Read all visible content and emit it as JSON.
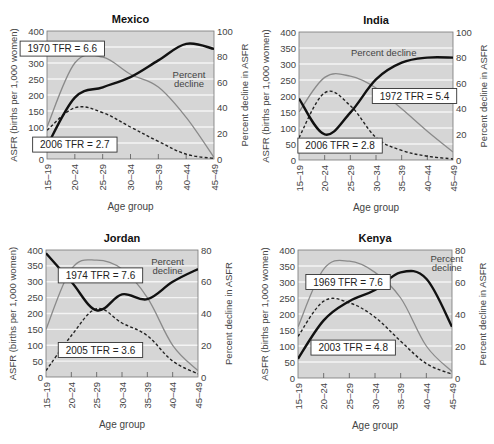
{
  "figure": {
    "colors": {
      "plot_bg": "#d6d6d6",
      "gridline": "#f4f4f4",
      "asfr_early": "#8a8a8a",
      "asfr_late": "#222222",
      "percent_decline": "#111111",
      "text": "#444444",
      "title": "#111111"
    }
  },
  "chart_data": [
    {
      "type": "line",
      "title": "Mexico",
      "xlabel": "Age group",
      "ylabel": "ASFR (births per 1,000 women)",
      "y2label": "Percent decline in ASFR",
      "categories": [
        "15–19",
        "20–24",
        "25–29",
        "30–34",
        "35–39",
        "40–44",
        "45–49"
      ],
      "ylim": [
        0,
        400
      ],
      "yticks": [
        0,
        50,
        100,
        150,
        200,
        250,
        300,
        350,
        400
      ],
      "y2lim": [
        0,
        100
      ],
      "y2ticks": [
        0,
        20,
        40,
        60,
        80,
        100
      ],
      "series": [
        {
          "name": "1970 TFR = 6.6",
          "role": "early",
          "axis": "left",
          "values": [
            100,
            300,
            318,
            265,
            225,
            130,
            5
          ]
        },
        {
          "name": "2006 TFR = 2.7",
          "role": "late",
          "axis": "left",
          "values": [
            90,
            160,
            145,
            100,
            55,
            15,
            2
          ]
        },
        {
          "name": "Percent decline",
          "role": "decline",
          "axis": "right",
          "values": [
            10,
            48,
            56,
            64,
            77,
            90,
            86
          ]
        }
      ],
      "annotations": [
        {
          "text": "1970 TFR = 6.6",
          "boxed": true,
          "x": 0.55,
          "y": 345
        },
        {
          "text": "2006 TFR = 2.7",
          "boxed": true,
          "x": 1.0,
          "y": 45
        },
        {
          "text": "Percent",
          "boxed": false,
          "x": 5.1,
          "y": 265
        },
        {
          "text": "decline",
          "boxed": false,
          "x": 5.1,
          "y": 235
        }
      ],
      "frame": {
        "x": 47,
        "y": 31,
        "w": 167,
        "h": 128
      }
    },
    {
      "type": "line",
      "title": "India",
      "xlabel": "Age group",
      "ylabel": "ASFR (births per 1,000 women)",
      "y2label": "Percent decline in ASFR",
      "categories": [
        "15–19",
        "20–24",
        "25–29",
        "30–34",
        "35–39",
        "40–44",
        "45–49"
      ],
      "ylim": [
        0,
        400
      ],
      "yticks": [
        0,
        50,
        100,
        150,
        200,
        250,
        300,
        350,
        400
      ],
      "y2lim": [
        0,
        100
      ],
      "y2ticks": [
        0,
        20,
        40,
        60,
        80,
        100
      ],
      "series": [
        {
          "name": "1972 TFR = 5.4",
          "role": "early",
          "axis": "left",
          "values": [
            150,
            258,
            262,
            225,
            160,
            90,
            25
          ]
        },
        {
          "name": "2006 TFR = 2.8",
          "role": "late",
          "axis": "left",
          "values": [
            70,
            210,
            170,
            70,
            30,
            12,
            3
          ]
        },
        {
          "name": "Percent decline",
          "role": "decline",
          "axis": "right",
          "values": [
            48,
            20,
            37,
            63,
            76,
            80,
            80
          ]
        }
      ],
      "annotations": [
        {
          "text": "Percent decline",
          "boxed": false,
          "x": 3.3,
          "y": 335
        },
        {
          "text": "1972 TFR = 5.4",
          "boxed": true,
          "x": 4.5,
          "y": 200
        },
        {
          "text": "2006 TFR = 2.8",
          "boxed": true,
          "x": 1.6,
          "y": 45
        }
      ],
      "frame": {
        "x": 299,
        "y": 32,
        "w": 154,
        "h": 128
      }
    },
    {
      "type": "line",
      "title": "Jordan",
      "xlabel": "Age group",
      "ylabel": "ASFR (births per 1,000 women)",
      "y2label": "Percent decline in ASFR",
      "categories": [
        "15–19",
        "20–24",
        "25–29",
        "30–34",
        "35–39",
        "40–44",
        "45–49"
      ],
      "ylim": [
        0,
        400
      ],
      "yticks": [
        0,
        50,
        100,
        150,
        200,
        250,
        300,
        350,
        400
      ],
      "y2lim": [
        0,
        80
      ],
      "y2ticks": [
        0,
        20,
        40,
        60,
        80
      ],
      "series": [
        {
          "name": "1974 TFR = 7.6",
          "role": "early",
          "axis": "left",
          "values": [
            150,
            340,
            368,
            340,
            250,
            100,
            20
          ]
        },
        {
          "name": "2005 TFR = 3.6",
          "role": "late",
          "axis": "left",
          "values": [
            20,
            130,
            215,
            170,
            130,
            50,
            10
          ]
        },
        {
          "name": "Percent decline",
          "role": "decline",
          "axis": "right",
          "values": [
            78,
            60,
            42,
            52,
            49,
            60,
            68
          ]
        }
      ],
      "annotations": [
        {
          "text": "1974 TFR = 7.6",
          "boxed": true,
          "x": 2.15,
          "y": 320
        },
        {
          "text": "2005 TFR = 3.6",
          "boxed": true,
          "x": 2.15,
          "y": 85
        },
        {
          "text": "Percent",
          "boxed": false,
          "x": 4.8,
          "y": 365
        },
        {
          "text": "decline",
          "boxed": false,
          "x": 4.8,
          "y": 335
        }
      ],
      "frame": {
        "x": 46,
        "y": 250,
        "w": 152,
        "h": 127
      }
    },
    {
      "type": "line",
      "title": "Kenya",
      "xlabel": "Age group",
      "ylabel": "ASFR (births per 1,000 women)",
      "y2label": "Percent decline in ASFR",
      "categories": [
        "15–19",
        "20–24",
        "25–29",
        "30–34",
        "35–39",
        "40–44",
        "45–49"
      ],
      "ylim": [
        0,
        400
      ],
      "yticks": [
        0,
        50,
        100,
        150,
        200,
        250,
        300,
        350,
        400
      ],
      "y2lim": [
        0,
        80
      ],
      "y2ticks": [
        0,
        20,
        40,
        60,
        80
      ],
      "series": [
        {
          "name": "1969 TFR = 7.6",
          "role": "early",
          "axis": "left",
          "values": [
            160,
            340,
            365,
            330,
            250,
            100,
            20
          ]
        },
        {
          "name": "2003 TFR = 4.8",
          "role": "late",
          "axis": "left",
          "values": [
            130,
            240,
            235,
            190,
            115,
            45,
            12
          ]
        },
        {
          "name": "Percent decline",
          "role": "decline",
          "axis": "right",
          "values": [
            12,
            36,
            48,
            55,
            66,
            62,
            32
          ]
        }
      ],
      "annotations": [
        {
          "text": "1969 TFR = 7.6",
          "boxed": true,
          "x": 1.95,
          "y": 300
        },
        {
          "text": "2003 TFR = 4.8",
          "boxed": true,
          "x": 2.15,
          "y": 95
        },
        {
          "text": "Percent",
          "boxed": false,
          "x": 5.8,
          "y": 375
        },
        {
          "text": "decline",
          "boxed": false,
          "x": 5.8,
          "y": 345
        }
      ],
      "frame": {
        "x": 298,
        "y": 250,
        "w": 154,
        "h": 128
      }
    }
  ]
}
